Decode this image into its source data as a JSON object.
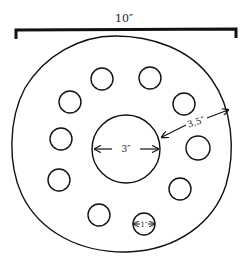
{
  "diagram": {
    "overall_width_label": "10″",
    "center_hole_label": "3″",
    "ring_width_label": "3.5″",
    "small_hole_label": "1″",
    "small_hole_count": 9
  }
}
